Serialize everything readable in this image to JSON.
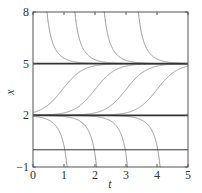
{
  "chart_data": {
    "type": "line",
    "title": "",
    "xlabel": "t",
    "ylabel": "x",
    "xlim": [
      0,
      5
    ],
    "ylim": [
      -1,
      8
    ],
    "xticks": [
      0,
      1,
      2,
      3,
      4,
      5
    ],
    "yticks": [
      -1,
      2,
      5,
      8
    ],
    "xtick_labels": [
      "0",
      "1",
      "2",
      "3",
      "4",
      "5"
    ],
    "ytick_labels": [
      "−1",
      "2",
      "5",
      "8"
    ],
    "grid": false,
    "legend": null,
    "model": "dx/dt = (x - 2)(5 - x)",
    "equilibria": [
      {
        "x": 5,
        "stability": "stable"
      },
      {
        "x": 2,
        "stability": "unstable"
      }
    ],
    "reference_lines": [
      {
        "y": 5,
        "label": "equilibrium x=5"
      },
      {
        "y": 2,
        "label": "equilibrium x=2"
      },
      {
        "y": 0,
        "label": "x=0 axis line"
      }
    ],
    "series": [
      {
        "name": "above-5 curve 1",
        "family": "above",
        "t0": 0.22
      },
      {
        "name": "above-5 curve 2",
        "family": "above",
        "t0": 1.12
      },
      {
        "name": "above-5 curve 3",
        "family": "above",
        "t0": 2.07
      },
      {
        "name": "above-5 curve 4",
        "family": "above",
        "t0": 3.17
      },
      {
        "name": "between curve 1",
        "family": "between",
        "t0": 0.95
      },
      {
        "name": "between curve 2",
        "family": "between",
        "t0": 2.0
      },
      {
        "name": "between curve 3",
        "family": "between",
        "t0": 3.0
      },
      {
        "name": "between curve 4",
        "family": "between",
        "t0": 4.0
      },
      {
        "name": "below-2 curve 1",
        "family": "below",
        "t0": 1.33
      },
      {
        "name": "below-2 curve 2",
        "family": "below",
        "t0": 2.28
      },
      {
        "name": "below-2 curve 3",
        "family": "below",
        "t0": 3.28
      },
      {
        "name": "below-2 curve 4",
        "family": "below",
        "t0": 4.33
      }
    ],
    "colors": {
      "curve": "#8a8a8a",
      "equilibrium": "#333333",
      "frame": "#555555"
    }
  }
}
